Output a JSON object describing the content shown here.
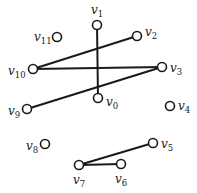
{
  "diagram": {
    "type": "graph",
    "nodes": [
      {
        "id": "v0",
        "label": "v",
        "sub": "0",
        "x": 98,
        "y": 98,
        "lx": 106,
        "ly": 106
      },
      {
        "id": "v1",
        "label": "v",
        "sub": "1",
        "x": 97,
        "y": 25,
        "lx": 91,
        "ly": 14
      },
      {
        "id": "v2",
        "label": "v",
        "sub": "2",
        "x": 137,
        "y": 36,
        "lx": 145,
        "ly": 36
      },
      {
        "id": "v3",
        "label": "v",
        "sub": "3",
        "x": 162,
        "y": 67,
        "lx": 170,
        "ly": 72
      },
      {
        "id": "v4",
        "label": "v",
        "sub": "4",
        "x": 170,
        "y": 106,
        "lx": 178,
        "ly": 110
      },
      {
        "id": "v5",
        "label": "v",
        "sub": "5",
        "x": 153,
        "y": 143,
        "lx": 161,
        "ly": 148
      },
      {
        "id": "v6",
        "label": "v",
        "sub": "6",
        "x": 121,
        "y": 164,
        "lx": 115,
        "ly": 183
      },
      {
        "id": "v7",
        "label": "v",
        "sub": "7",
        "x": 79,
        "y": 165,
        "lx": 73,
        "ly": 184
      },
      {
        "id": "v8",
        "label": "v",
        "sub": "8",
        "x": 45,
        "y": 144,
        "lx": 26,
        "ly": 150
      },
      {
        "id": "v9",
        "label": "v",
        "sub": "9",
        "x": 27,
        "y": 109,
        "lx": 8,
        "ly": 115
      },
      {
        "id": "v10",
        "label": "v",
        "sub": "10",
        "x": 33,
        "y": 69,
        "lx": 8,
        "ly": 75
      },
      {
        "id": "v11",
        "label": "v",
        "sub": "11",
        "x": 57,
        "y": 37,
        "lx": 34,
        "ly": 41
      }
    ],
    "edges": [
      [
        "v1",
        "v0"
      ],
      [
        "v10",
        "v2"
      ],
      [
        "v10",
        "v3"
      ],
      [
        "v3",
        "v9"
      ],
      [
        "v7",
        "v5"
      ],
      [
        "v7",
        "v6"
      ]
    ],
    "colors": {
      "stroke": "#1a1a1a",
      "background": "#ffffff"
    }
  }
}
